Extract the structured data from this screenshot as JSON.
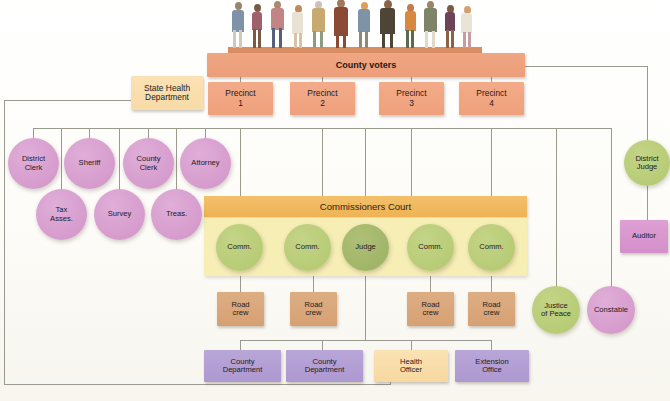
{
  "diagram": {
    "top": {
      "voters": "County voters",
      "people_count": 14
    },
    "precincts": [
      {
        "line1": "Precinct",
        "line2": "1"
      },
      {
        "line1": "Precinct",
        "line2": "2"
      },
      {
        "line1": "Precinct",
        "line2": "3"
      },
      {
        "line1": "Precinct",
        "line2": "4"
      }
    ],
    "state_health": {
      "line1": "State Health",
      "line2": "Department"
    },
    "elected_officials_row1": [
      {
        "line1": "District",
        "line2": "Clerk"
      },
      {
        "line1": "Sheriff",
        "line2": ""
      },
      {
        "line1": "County",
        "line2": "Clerk"
      },
      {
        "line1": "Attorney",
        "line2": ""
      }
    ],
    "elected_officials_row2": [
      {
        "line1": "Tax",
        "line2": "Asses."
      },
      {
        "line1": "Survey",
        "line2": ""
      },
      {
        "line1": "Treas.",
        "line2": ""
      }
    ],
    "court": {
      "header": "Commissioners Court",
      "members": [
        {
          "label": "Comm."
        },
        {
          "label": "Comm."
        },
        {
          "label": "Judge"
        },
        {
          "label": "Comm."
        },
        {
          "label": "Comm."
        }
      ]
    },
    "road_crews": [
      {
        "line1": "Road",
        "line2": "crew"
      },
      {
        "line1": "Road",
        "line2": "crew"
      },
      {
        "line1": "Road",
        "line2": "crew"
      },
      {
        "line1": "Road",
        "line2": "crew"
      }
    ],
    "departments": [
      {
        "line1": "County",
        "line2": "Department"
      },
      {
        "line1": "County",
        "line2": "Department"
      },
      {
        "line1": "Health",
        "line2": "Officer"
      },
      {
        "line1": "Extension",
        "line2": "Office"
      }
    ],
    "right_branch": {
      "district_judge": {
        "line1": "District",
        "line2": "Judge"
      },
      "auditor": {
        "line1": "Auditor",
        "line2": ""
      },
      "justice_of_peace": {
        "line1": "Justice",
        "line2": "of Peace"
      },
      "constable": {
        "line1": "Constable",
        "line2": ""
      }
    },
    "colors": {
      "voters": "#ec9e79",
      "precinct": "#efa07c",
      "state_health": "#f8dba6",
      "pink": "#d194c8",
      "green": "#b3c86f",
      "green_dark": "#9bb162",
      "road": "#d6a073",
      "purple": "#ad98d0",
      "court_header": "#eeb354",
      "court_body": "#f7eeb6",
      "line": "#9a9a8e"
    }
  }
}
